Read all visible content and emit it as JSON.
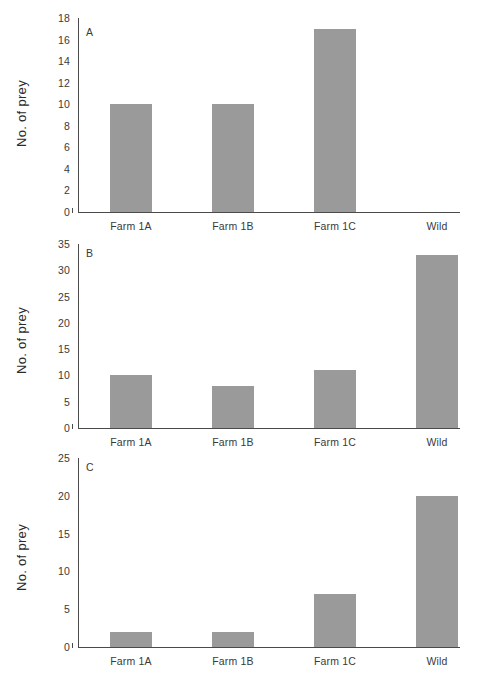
{
  "figure": {
    "background_color": "#ffffff",
    "bar_color": "#9a9a9a",
    "axis_color": "#4a4a4a",
    "text_color": "#3a3a3a"
  },
  "panels": [
    {
      "letter": "A",
      "ylabel": "No. of prey",
      "yticks": [
        "0",
        "2",
        "4",
        "6",
        "8",
        "10",
        "12",
        "14",
        "16",
        "18"
      ],
      "xticks": [
        "Farm 1A",
        "Farm 1B",
        "Farm 1C",
        "Wild"
      ]
    },
    {
      "letter": "B",
      "ylabel": "No. of prey",
      "yticks": [
        "0",
        "5",
        "10",
        "15",
        "20",
        "25",
        "30",
        "35"
      ],
      "xticks": [
        "Farm 1A",
        "Farm 1B",
        "Farm 1C",
        "Wild"
      ]
    },
    {
      "letter": "C",
      "ylabel": "No. of prey",
      "yticks": [
        "0",
        "5",
        "10",
        "15",
        "20",
        "25"
      ],
      "xticks": [
        "Farm 1A",
        "Farm 1B",
        "Farm 1C",
        "Wild"
      ]
    }
  ],
  "chart_data": [
    {
      "type": "bar",
      "title": "A",
      "categories": [
        "Farm 1A",
        "Farm 1B",
        "Farm 1C",
        "Wild"
      ],
      "values": [
        10,
        10,
        17,
        0
      ],
      "xlabel": "",
      "ylabel": "No. of prey",
      "ylim": [
        0,
        18
      ],
      "ytick_step": 2,
      "grid": false,
      "legend": false
    },
    {
      "type": "bar",
      "title": "B",
      "categories": [
        "Farm 1A",
        "Farm 1B",
        "Farm 1C",
        "Wild"
      ],
      "values": [
        10,
        8,
        11,
        33
      ],
      "xlabel": "",
      "ylabel": "No. of prey",
      "ylim": [
        0,
        35
      ],
      "ytick_step": 5,
      "grid": false,
      "legend": false
    },
    {
      "type": "bar",
      "title": "C",
      "categories": [
        "Farm 1A",
        "Farm 1B",
        "Farm 1C",
        "Wild"
      ],
      "values": [
        2,
        2,
        7,
        20
      ],
      "xlabel": "",
      "ylabel": "No. of prey",
      "ylim": [
        0,
        25
      ],
      "ytick_step": 5,
      "grid": false,
      "legend": false
    }
  ]
}
